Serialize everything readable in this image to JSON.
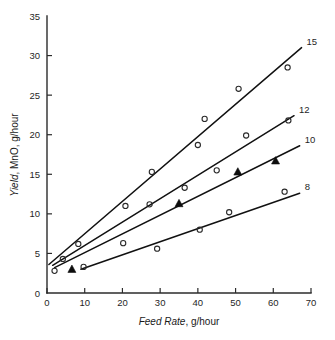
{
  "chart_data": {
    "type": "scatter",
    "title": "",
    "xlabel": "Feed Rate, g/hour",
    "xlabel_italic_part": "Feed Rate",
    "xlabel_plain_part": ", g/hour",
    "ylabel": "Yield, MnO, g/hour",
    "ylabel_italic_part": "Yield",
    "ylabel_plain_part": ", MnO, g/hour",
    "xlim": [
      0,
      70
    ],
    "ylim": [
      0,
      35
    ],
    "xticks": [
      0,
      10,
      20,
      30,
      40,
      50,
      60,
      70
    ],
    "yticks": [
      0,
      5,
      10,
      15,
      20,
      25,
      30,
      35
    ],
    "grid": false,
    "legend_position": "right-of-line-ends",
    "marker_styles": {
      "open_circle": "open circle",
      "filled_triangle": "filled triangle"
    },
    "series": [
      {
        "name": "15",
        "label": "15",
        "line": {
          "x0": 0.5,
          "y0": 3.6,
          "x1": 67.5,
          "y1": 31.0
        },
        "points": [
          {
            "x": 2.0,
            "y": 2.8,
            "marker": "open_circle"
          },
          {
            "x": 4.2,
            "y": 4.3,
            "marker": "open_circle"
          },
          {
            "x": 8.3,
            "y": 6.2,
            "marker": "open_circle"
          },
          {
            "x": 20.8,
            "y": 11.0,
            "marker": "open_circle"
          },
          {
            "x": 27.8,
            "y": 15.3,
            "marker": "open_circle"
          },
          {
            "x": 40.0,
            "y": 18.7,
            "marker": "open_circle"
          },
          {
            "x": 41.8,
            "y": 22.0,
            "marker": "open_circle"
          },
          {
            "x": 50.8,
            "y": 25.8,
            "marker": "open_circle"
          },
          {
            "x": 63.8,
            "y": 28.5,
            "marker": "open_circle"
          }
        ]
      },
      {
        "name": "12",
        "label": "12",
        "line": {
          "x0": 1.5,
          "y0": 3.5,
          "x1": 65.5,
          "y1": 22.4
        },
        "points": [
          {
            "x": 20.2,
            "y": 6.3,
            "marker": "open_circle"
          },
          {
            "x": 27.2,
            "y": 11.2,
            "marker": "open_circle"
          },
          {
            "x": 36.5,
            "y": 13.3,
            "marker": "open_circle"
          },
          {
            "x": 45.0,
            "y": 15.5,
            "marker": "open_circle"
          },
          {
            "x": 52.8,
            "y": 19.9,
            "marker": "open_circle"
          },
          {
            "x": 64.0,
            "y": 21.8,
            "marker": "open_circle"
          }
        ]
      },
      {
        "name": "10",
        "label": "10",
        "line": {
          "x0": 2.0,
          "y0": 3.2,
          "x1": 67.0,
          "y1": 18.6
        },
        "points": [
          {
            "x": 6.6,
            "y": 3.0,
            "marker": "filled_triangle"
          },
          {
            "x": 35.0,
            "y": 11.3,
            "marker": "filled_triangle"
          },
          {
            "x": 50.6,
            "y": 15.3,
            "marker": "filled_triangle"
          },
          {
            "x": 60.6,
            "y": 16.7,
            "marker": "filled_triangle"
          }
        ]
      },
      {
        "name": "8",
        "label": "8",
        "line": {
          "x0": 9.0,
          "y0": 3.0,
          "x1": 67.0,
          "y1": 12.6
        },
        "points": [
          {
            "x": 9.7,
            "y": 3.3,
            "marker": "open_circle"
          },
          {
            "x": 29.2,
            "y": 5.6,
            "marker": "open_circle"
          },
          {
            "x": 40.5,
            "y": 8.0,
            "marker": "open_circle"
          },
          {
            "x": 48.3,
            "y": 10.2,
            "marker": "open_circle"
          },
          {
            "x": 63.0,
            "y": 12.8,
            "marker": "open_circle"
          }
        ]
      }
    ]
  },
  "axes_geometry": {
    "left_px": 47,
    "right_px": 311,
    "top_px": 16,
    "bottom_px": 293
  }
}
